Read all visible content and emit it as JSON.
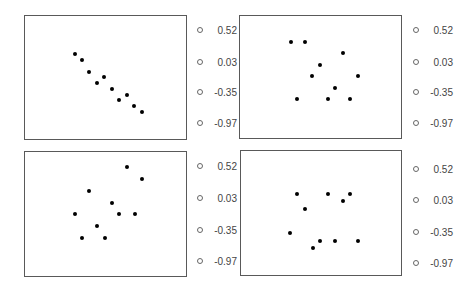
{
  "chart_data": [
    {
      "type": "scatter",
      "panel": "top-left",
      "title": "",
      "xlabel": "",
      "ylabel": "",
      "legend": [
        "0.52",
        "0.03",
        "-0.35",
        "-0.97"
      ],
      "legend_position": "right",
      "grid": false,
      "box": {
        "left": 24,
        "top": 15,
        "width": 163,
        "height": 125
      },
      "points_px": [
        [
          75,
          54
        ],
        [
          82,
          60
        ],
        [
          89,
          72
        ],
        [
          97,
          83
        ],
        [
          104,
          77
        ],
        [
          112,
          89
        ],
        [
          119,
          100
        ],
        [
          127,
          95
        ],
        [
          134,
          106
        ],
        [
          142,
          112
        ]
      ]
    },
    {
      "type": "scatter",
      "panel": "top-right",
      "title": "",
      "xlabel": "",
      "ylabel": "",
      "legend": [
        "0.52",
        "0.03",
        "-0.35",
        "-0.97"
      ],
      "legend_position": "right",
      "grid": false,
      "box": {
        "left": 239,
        "top": 15,
        "width": 163,
        "height": 124
      },
      "points_px": [
        [
          291,
          42
        ],
        [
          305,
          42
        ],
        [
          343,
          53
        ],
        [
          320,
          65
        ],
        [
          312,
          76
        ],
        [
          358,
          76
        ],
        [
          335,
          88
        ],
        [
          297,
          99
        ],
        [
          328,
          99
        ],
        [
          350,
          99
        ]
      ]
    },
    {
      "type": "scatter",
      "panel": "bottom-left",
      "title": "",
      "xlabel": "",
      "ylabel": "",
      "legend": [
        "0.52",
        "0.03",
        "-0.35",
        "-0.97"
      ],
      "legend_position": "right",
      "grid": false,
      "box": {
        "left": 24,
        "top": 151,
        "width": 163,
        "height": 126
      },
      "points_px": [
        [
          127,
          167
        ],
        [
          142,
          179
        ],
        [
          89,
          191
        ],
        [
          112,
          203
        ],
        [
          75,
          214
        ],
        [
          119,
          214
        ],
        [
          135,
          214
        ],
        [
          97,
          226
        ],
        [
          82,
          238
        ],
        [
          105,
          238
        ]
      ]
    },
    {
      "type": "scatter",
      "panel": "bottom-right",
      "title": "",
      "xlabel": "",
      "ylabel": "",
      "legend": [
        "0.52",
        "0.03",
        "-0.35",
        "-0.97"
      ],
      "legend_position": "right",
      "grid": false,
      "box": {
        "left": 240,
        "top": 150,
        "width": 162,
        "height": 126
      },
      "points_px": [
        [
          297,
          194
        ],
        [
          328,
          194
        ],
        [
          350,
          194
        ],
        [
          343,
          201
        ],
        [
          305,
          209
        ],
        [
          290,
          233
        ],
        [
          320,
          241
        ],
        [
          335,
          241
        ],
        [
          358,
          241
        ],
        [
          313,
          248
        ]
      ]
    }
  ],
  "legends": [
    {
      "x": 197,
      "ys": [
        31,
        63,
        93,
        124
      ],
      "labels": [
        "0.52",
        "0.03",
        "-0.35",
        "-0.97"
      ]
    },
    {
      "x": 413,
      "ys": [
        31,
        63,
        93,
        124
      ],
      "labels": [
        "0.52",
        "0.03",
        "-0.35",
        "-0.97"
      ]
    },
    {
      "x": 197,
      "ys": [
        167,
        199,
        231,
        262
      ],
      "labels": [
        "0.52",
        "0.03",
        "-0.35",
        "-0.97"
      ]
    },
    {
      "x": 413,
      "ys": [
        170,
        201,
        233,
        264
      ],
      "labels": [
        "0.52",
        "0.03",
        "-0.35",
        "-0.97"
      ]
    }
  ]
}
